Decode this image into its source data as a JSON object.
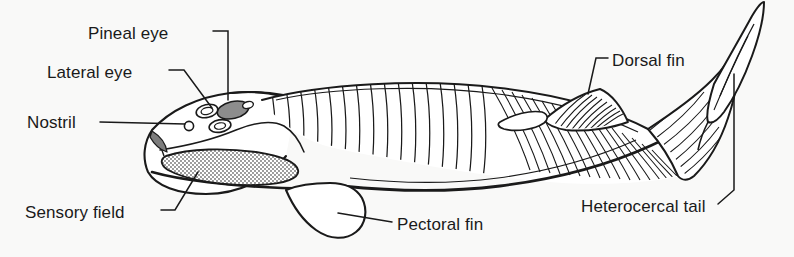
{
  "figure": {
    "kind": "anatomical-diagram",
    "background_color": "#f9f9f8",
    "ink_color": "#1a1a1a",
    "shade_color": "#8c8c8c"
  },
  "labels": {
    "pineal_eye": "Pineal eye",
    "lateral_eye": "Lateral eye",
    "nostril": "Nostril",
    "sensory_field": "Sensory field",
    "pectoral_fin": "Pectoral fin",
    "dorsal_fin": "Dorsal fin",
    "heterocercal_tail": "Heterocercal tail"
  }
}
